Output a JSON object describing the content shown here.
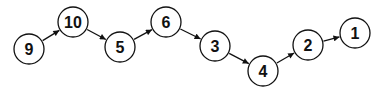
{
  "diagram": {
    "type": "linked-list",
    "node_radius": 15,
    "stroke_color": "#111111",
    "fill_color": "#ffffff",
    "nodes": [
      {
        "id": "n9",
        "label": "9",
        "cx": 29,
        "cy": 49
      },
      {
        "id": "n10",
        "label": "10",
        "cx": 73,
        "cy": 22
      },
      {
        "id": "n5",
        "label": "5",
        "cx": 120,
        "cy": 47
      },
      {
        "id": "n6",
        "label": "6",
        "cx": 166,
        "cy": 22
      },
      {
        "id": "n3",
        "label": "3",
        "cx": 215,
        "cy": 46
      },
      {
        "id": "n4",
        "label": "4",
        "cx": 263,
        "cy": 71
      },
      {
        "id": "n2",
        "label": "2",
        "cx": 308,
        "cy": 45
      },
      {
        "id": "n1",
        "label": "1",
        "cx": 355,
        "cy": 33
      }
    ],
    "edges": [
      {
        "from": "n9",
        "to": "n10"
      },
      {
        "from": "n10",
        "to": "n5"
      },
      {
        "from": "n5",
        "to": "n6"
      },
      {
        "from": "n6",
        "to": "n3"
      },
      {
        "from": "n3",
        "to": "n4"
      },
      {
        "from": "n4",
        "to": "n2"
      },
      {
        "from": "n2",
        "to": "n1"
      }
    ]
  }
}
